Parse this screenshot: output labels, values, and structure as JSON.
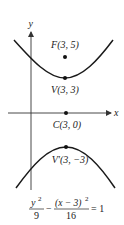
{
  "diagram": {
    "colors": {
      "curve": "#1a1a1a",
      "axis": "#333333",
      "point": "#111111",
      "text": "#222222"
    },
    "axes": {
      "x_label": "x",
      "y_label": "y"
    },
    "points": [
      {
        "id": "F",
        "label": "F(3, 5)",
        "x": 3,
        "y": 5
      },
      {
        "id": "V",
        "label": "V(3, 3)",
        "x": 3,
        "y": 3
      },
      {
        "id": "C",
        "label": "C(3, 0)",
        "x": 3,
        "y": 0
      },
      {
        "id": "V2",
        "label": "V′(3, −3)",
        "x": 3,
        "y": -3
      }
    ],
    "equation": {
      "term1_num": "y",
      "term1_exp": "2",
      "term1_den": "9",
      "minus": "−",
      "term2_num": "(x − 3)",
      "term2_exp": "2",
      "term2_den": "16",
      "equals": "= 1"
    }
  }
}
